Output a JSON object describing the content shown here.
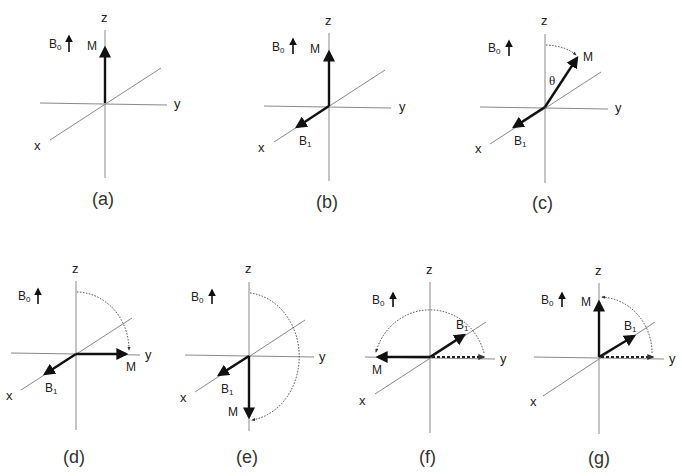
{
  "figure": {
    "title": "",
    "colors": {
      "axis": "#8a8a8a",
      "vector": "#111111",
      "path": "#555555",
      "background": "#ffffff"
    },
    "panels": [
      {
        "id": "a",
        "caption": "(a)",
        "axis_labels": {
          "z": "z",
          "y": "y",
          "x": "x"
        },
        "b0_label": "B",
        "b0_sub": "0",
        "m_label": "M",
        "b1_label": "",
        "b1_sub": "",
        "description": "M aligned along +z with B0; no B1 applied"
      },
      {
        "id": "b",
        "caption": "(b)",
        "axis_labels": {
          "z": "z",
          "y": "y",
          "x": "x"
        },
        "b0_label": "B",
        "b0_sub": "0",
        "m_label": "M",
        "b1_label": "B",
        "b1_sub": "1",
        "description": "B1 applied along +x; M along +z"
      },
      {
        "id": "c",
        "caption": "(c)",
        "axis_labels": {
          "z": "z",
          "y": "y",
          "x": "x"
        },
        "b0_label": "B",
        "b0_sub": "0",
        "m_label": "M",
        "b1_label": "B",
        "b1_sub": "1",
        "angle_label": "θ",
        "description": "M tipped by angle θ from z toward y"
      },
      {
        "id": "d",
        "caption": "(d)",
        "axis_labels": {
          "z": "z",
          "y": "y",
          "x": "x"
        },
        "b0_label": "B",
        "b0_sub": "0",
        "m_label": "M",
        "b1_label": "B",
        "b1_sub": "1",
        "description": "90° pulse: M along +y"
      },
      {
        "id": "e",
        "caption": "(e)",
        "axis_labels": {
          "z": "z",
          "y": "y",
          "x": "x"
        },
        "b0_label": "B",
        "b0_sub": "0",
        "m_label": "M",
        "b1_label": "B",
        "b1_sub": "1",
        "description": "180° pulse: M along -z"
      },
      {
        "id": "f",
        "caption": "(f)",
        "axis_labels": {
          "z": "z",
          "y": "y",
          "x": "x"
        },
        "b0_label": "B",
        "b0_sub": "0",
        "m_label": "M",
        "b1_label": "B",
        "b1_sub": "1",
        "description": "B1 along y-x plane; M rotated to -y"
      },
      {
        "id": "g",
        "caption": "(g)",
        "axis_labels": {
          "z": "z",
          "y": "y",
          "x": "x"
        },
        "b0_label": "B",
        "b0_sub": "0",
        "m_label": "M",
        "b1_label": "B",
        "b1_sub": "1",
        "description": "M back along +z"
      }
    ]
  }
}
